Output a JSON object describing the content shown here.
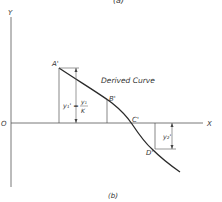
{
  "figure": {
    "top_caption": "(a)",
    "caption": "(b)",
    "axis_labels": {
      "y": "Y",
      "x": "X",
      "origin": "O"
    },
    "curve_label": "Derived Curve",
    "points": {
      "a": "A'",
      "b": "B'",
      "c": "C'",
      "d": "D'"
    },
    "dimension_left": {
      "lhs": "y₁' =",
      "num": "y₁",
      "den": "K"
    },
    "dimension_right": "y₂'",
    "colors": {
      "line": "#2a2a2a",
      "text": "#333333",
      "background": "#ffffff"
    }
  }
}
